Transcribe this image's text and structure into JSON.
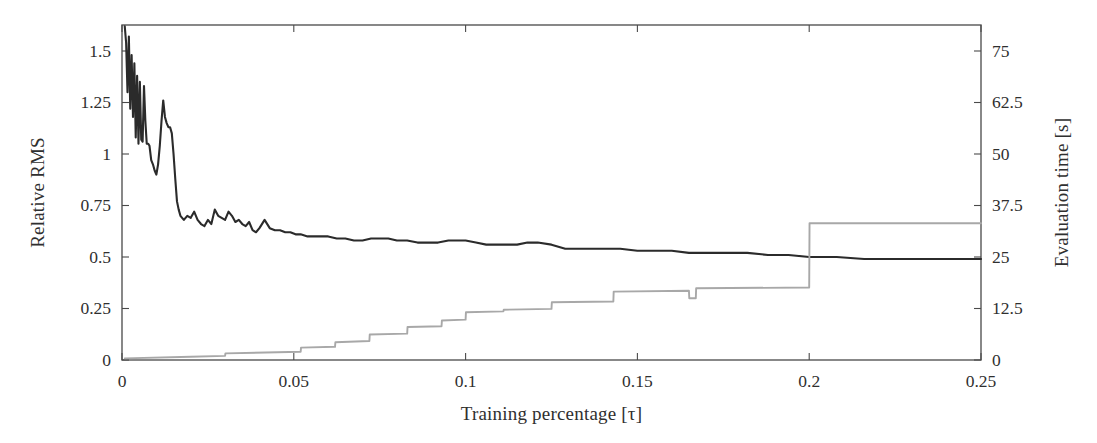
{
  "chart_data": {
    "type": "line",
    "title": "",
    "xlabel": "Training percentage [τ]",
    "ylabel": "Relative RMS",
    "ylabel_right": "Evaluation time [s]",
    "xlim": [
      0,
      0.25
    ],
    "ylim": [
      0,
      1.6262
    ],
    "ylim_right": [
      0,
      81.31
    ],
    "grid": false,
    "legend": "none",
    "xticks": [
      "0",
      "0.05",
      "0.1",
      "0.15",
      "0.2",
      "0.25"
    ],
    "xtick_values": [
      0,
      0.05,
      0.1,
      0.15,
      0.2,
      0.25
    ],
    "yticks_left": [
      "0",
      "0.25",
      "0.5",
      "0.75",
      "1",
      "1.25",
      "1.5"
    ],
    "ytick_values_left": [
      0,
      0.25,
      0.5,
      0.75,
      1,
      1.25,
      1.5
    ],
    "yticks_right": [
      "0",
      "12.5",
      "25",
      "37.5",
      "50",
      "62.5",
      "75"
    ],
    "ytick_values_right": [
      0,
      12.5,
      25,
      37.5,
      50,
      62.5,
      75
    ],
    "colors": {
      "relative_rms": "#2b2b2b",
      "evaluation_time": "#a8a8a8",
      "axis": "#565656",
      "background": "#ffffff"
    },
    "series": [
      {
        "name": "Relative RMS",
        "axis": "left",
        "color": "#2b2b2b",
        "x": [
          0.0008,
          0.0012,
          0.0016,
          0.002,
          0.0024,
          0.0028,
          0.0032,
          0.0036,
          0.004,
          0.0044,
          0.0048,
          0.0052,
          0.0056,
          0.006,
          0.0064,
          0.0068,
          0.0072,
          0.0076,
          0.008,
          0.0085,
          0.009,
          0.0095,
          0.01,
          0.0105,
          0.011,
          0.0115,
          0.012,
          0.0125,
          0.013,
          0.0135,
          0.014,
          0.0145,
          0.015,
          0.0155,
          0.016,
          0.0165,
          0.017,
          0.0175,
          0.018,
          0.019,
          0.02,
          0.021,
          0.022,
          0.023,
          0.024,
          0.025,
          0.026,
          0.027,
          0.028,
          0.029,
          0.03,
          0.031,
          0.032,
          0.033,
          0.034,
          0.035,
          0.036,
          0.037,
          0.038,
          0.039,
          0.04,
          0.0415,
          0.043,
          0.0445,
          0.046,
          0.0475,
          0.049,
          0.0505,
          0.052,
          0.054,
          0.056,
          0.058,
          0.06,
          0.0625,
          0.065,
          0.0675,
          0.07,
          0.0725,
          0.075,
          0.0775,
          0.08,
          0.083,
          0.086,
          0.089,
          0.092,
          0.095,
          0.098,
          0.1,
          0.103,
          0.106,
          0.109,
          0.112,
          0.115,
          0.118,
          0.121,
          0.125,
          0.129,
          0.133,
          0.137,
          0.141,
          0.145,
          0.15,
          0.155,
          0.16,
          0.165,
          0.17,
          0.176,
          0.182,
          0.188,
          0.194,
          0.2,
          0.208,
          0.216,
          0.224,
          0.232,
          0.24,
          0.25
        ],
        "y": [
          1.62,
          1.54,
          1.3,
          1.57,
          1.22,
          1.48,
          1.18,
          1.44,
          1.08,
          1.38,
          1.05,
          1.35,
          1.07,
          1.06,
          1.33,
          1.16,
          1.05,
          1.05,
          1.04,
          0.97,
          0.95,
          0.92,
          0.9,
          0.95,
          1.04,
          1.16,
          1.26,
          1.18,
          1.15,
          1.13,
          1.13,
          1.1,
          1.0,
          0.88,
          0.77,
          0.73,
          0.7,
          0.69,
          0.68,
          0.7,
          0.69,
          0.72,
          0.68,
          0.66,
          0.65,
          0.68,
          0.66,
          0.73,
          0.7,
          0.69,
          0.68,
          0.72,
          0.7,
          0.67,
          0.68,
          0.66,
          0.65,
          0.67,
          0.63,
          0.62,
          0.64,
          0.68,
          0.64,
          0.63,
          0.63,
          0.62,
          0.62,
          0.61,
          0.61,
          0.6,
          0.6,
          0.6,
          0.6,
          0.59,
          0.59,
          0.58,
          0.58,
          0.59,
          0.59,
          0.59,
          0.58,
          0.58,
          0.57,
          0.57,
          0.57,
          0.58,
          0.58,
          0.58,
          0.57,
          0.56,
          0.56,
          0.56,
          0.56,
          0.57,
          0.57,
          0.56,
          0.54,
          0.54,
          0.54,
          0.54,
          0.54,
          0.53,
          0.53,
          0.53,
          0.52,
          0.52,
          0.52,
          0.52,
          0.51,
          0.51,
          0.5,
          0.5,
          0.49,
          0.49,
          0.49,
          0.49,
          0.49
        ]
      },
      {
        "name": "Evaluation time",
        "axis": "right",
        "color": "#a8a8a8",
        "x": [
          0.0008,
          0.02,
          0.03,
          0.0301,
          0.052,
          0.0521,
          0.062,
          0.0621,
          0.072,
          0.0721,
          0.083,
          0.0831,
          0.093,
          0.0931,
          0.1,
          0.1001,
          0.111,
          0.1111,
          0.125,
          0.1251,
          0.143,
          0.1431,
          0.165,
          0.1651,
          0.167,
          0.1671,
          0.2,
          0.2001,
          0.25
        ],
        "y": [
          0.4,
          0.8,
          1.0,
          1.6,
          2.0,
          3.0,
          3.2,
          4.3,
          4.6,
          6.2,
          6.4,
          8.0,
          8.2,
          9.6,
          9.8,
          11.6,
          11.8,
          12.2,
          12.4,
          14.0,
          14.2,
          16.6,
          16.8,
          15.0,
          15.0,
          17.4,
          17.6,
          33.2,
          33.2
        ]
      }
    ],
    "annotations": []
  }
}
